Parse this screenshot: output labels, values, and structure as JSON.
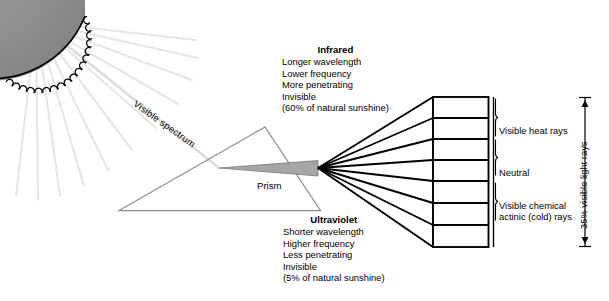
{
  "figure": {
    "background_color": "#ffffff",
    "ink_color": "#000000",
    "sun_fill": "#8c8c8c",
    "ray_color": "#e8e8e8",
    "prism_wedge_color": "#a8a8a8"
  },
  "sun": {
    "name": "sun",
    "position": "top-left",
    "rays_count": 11
  },
  "beam": {
    "label": "Visible spectrum"
  },
  "prism": {
    "label": "Prism"
  },
  "spectrum_blocks": [
    {
      "id": "infrared",
      "title": "Infrared",
      "lines": [
        "Longer wavelength",
        "Lower frequency",
        "More penetrating",
        "Invisible",
        "(60% of natural sunshine)"
      ]
    },
    {
      "id": "ultraviolet",
      "title": "Ultraviolet",
      "lines": [
        "Shorter wavelength",
        "Higher frequency",
        "Less penetrating",
        "Invisible",
        "(5% of natural sunshine)"
      ]
    }
  ],
  "spectrum_panel": {
    "bands_count": 7,
    "divider_rays": 8,
    "band_labels": [
      {
        "id": "visible-heat-rays",
        "line1": "Visible heat rays",
        "line2": ""
      },
      {
        "id": "neutral",
        "line1": "Neutral",
        "line2": ""
      },
      {
        "id": "visible-chemical-actinic",
        "line1": "Visible chemical",
        "line2": "actinic (cold) rays"
      }
    ],
    "measure": {
      "label": "35% visible light rays",
      "arrow": "double-headed-vertical"
    }
  }
}
